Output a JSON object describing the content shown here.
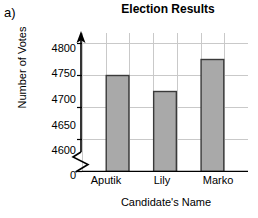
{
  "panel_label": "a)",
  "chart_data": {
    "type": "bar",
    "title": "Election Results",
    "xlabel": "Candidate's Name",
    "ylabel": "Number of Votes",
    "categories": [
      "Aputik",
      "Lily",
      "Marko"
    ],
    "values": [
      4750,
      4725,
      4775
    ],
    "ylim": [
      4600,
      4800
    ],
    "ytick_labels": [
      "4800",
      "4750",
      "4700",
      "4650",
      "4600",
      "0"
    ],
    "ytick_values": [
      4800,
      4750,
      4700,
      4650,
      4600,
      0
    ],
    "axis_break": true,
    "axis_break_label": "0",
    "grid": true,
    "grid_columns": 7,
    "legend": "none",
    "bar_fill": "#a9a9a9",
    "bar_stroke": "#3a3a3a",
    "grid_color": "#c9c9c9",
    "axis_color": "#000000"
  }
}
